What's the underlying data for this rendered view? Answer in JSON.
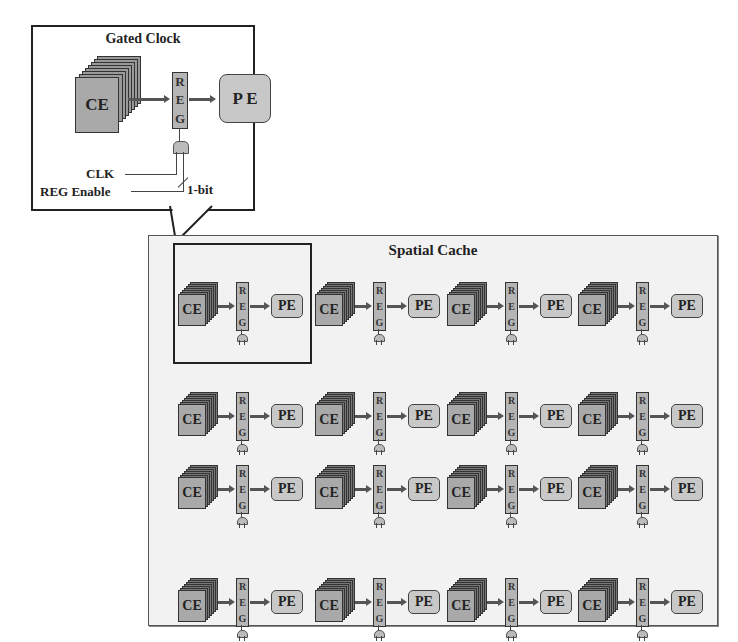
{
  "callout": {
    "title": "Gated Clock",
    "ce_label": "CE",
    "reg_letters": [
      "R",
      "E",
      "G"
    ],
    "pe_label": "P E",
    "clk_label": "CLK",
    "enable_label": "REG Enable",
    "bit_label": "1-bit"
  },
  "spatial_cache": {
    "title": "Spatial Cache",
    "cell": {
      "ce_label": "CE",
      "reg_letters": [
        "R",
        "E",
        "G"
      ],
      "pe_label": "PE"
    },
    "columns_x": [
      178,
      315,
      447,
      578
    ],
    "rows_y": [
      282,
      392,
      465,
      578
    ],
    "rows": 4,
    "columns": 4,
    "highlighted_cell": {
      "row": 0,
      "column": 0
    }
  },
  "colors": {
    "ce_front": "#a9a9a9",
    "ce_layers": "#777777",
    "reg": "#b5b5b5",
    "pe": "#c8c8c8",
    "background_panel": "#f2f2f2",
    "arrow": "#555555"
  }
}
